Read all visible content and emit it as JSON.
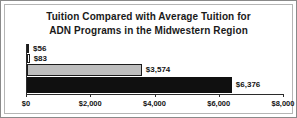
{
  "chart_data": {
    "type": "bar",
    "orientation": "horizontal",
    "title": "Tuition Compared with Average Tuition for ADN Programs in the Midwestern Region",
    "title_lines": [
      "Tuition Compared with Average Tuition for",
      "ADN Programs in the Midwestern Region"
    ],
    "xlabel": "",
    "ylabel": "",
    "categories": [
      "",
      "",
      "",
      ""
    ],
    "values": [
      56,
      83,
      3574,
      6376
    ],
    "data_labels": [
      "$56",
      "$83",
      "$3,574",
      "$6,376"
    ],
    "bars": [
      {
        "label": "$56",
        "value": 56,
        "fill": "#ffffff",
        "stroke": "#1c1c1c"
      },
      {
        "label": "$83",
        "value": 83,
        "fill": "#ffffff",
        "stroke": "#1c1c1c"
      },
      {
        "label": "$3,574",
        "value": 3574,
        "fill": "#bdbdbd",
        "stroke": "#1c1c1c"
      },
      {
        "label": "$6,376",
        "value": 6376,
        "fill": "#101010",
        "stroke": "#101010"
      }
    ],
    "xlim": [
      0,
      8000
    ],
    "xticks": [
      0,
      2000,
      4000,
      6000,
      8000
    ],
    "xtick_labels": [
      "$0",
      "$2,000",
      "$4,000",
      "$6,000",
      "$8,000"
    ],
    "grid": false,
    "legend": false,
    "legend_position": "none",
    "axis_color": "#2b2b2b",
    "text_color": "#141414",
    "background": "#ffffff",
    "border_color": "#8a8a8a"
  }
}
